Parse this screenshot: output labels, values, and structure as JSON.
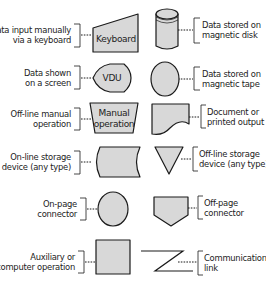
{
  "colors": {
    "shape_fill": "#d8d8d8",
    "stroke": "#1a1a1a",
    "text": "#222222",
    "background": "#ffffff"
  },
  "symbols": {
    "keyboard": {
      "shape_label": "Keyboard",
      "desc_line1": "Data input manually",
      "desc_line2": "via a keyboard"
    },
    "vdu": {
      "shape_label": "VDU",
      "desc_line1": "Data shown",
      "desc_line2": "on a screen"
    },
    "manual_operation": {
      "shape_label_line1": "Manual",
      "shape_label_line2": "operation",
      "desc_line1": "Off-line manual",
      "desc_line2": "operation"
    },
    "online_storage": {
      "desc_line1": "On-line storage",
      "desc_line2": "device (any type)"
    },
    "onpage_connector": {
      "desc_line1": "On-page",
      "desc_line2": "connector"
    },
    "auxiliary_operation": {
      "desc_line1": "Auxiliary or",
      "desc_line2": "computer operation"
    },
    "magnetic_disk": {
      "desc_line1": "Data stored on",
      "desc_line2": "magnetic disk"
    },
    "magnetic_tape": {
      "desc_line1": "Data stored on",
      "desc_line2": "magnetic tape"
    },
    "document": {
      "desc_line1": "Document or",
      "desc_line2": "printed output"
    },
    "offline_storage": {
      "desc_line1": "Off-line storage",
      "desc_line2": "device (any type)"
    },
    "offpage_connector": {
      "desc_line1": "Off-page",
      "desc_line2": "connector"
    },
    "communications_link": {
      "desc_line1": "Communications",
      "desc_line2": "link"
    }
  }
}
